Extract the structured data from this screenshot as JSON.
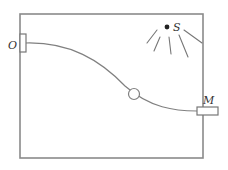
{
  "diagram": {
    "type": "physics-apparatus",
    "labels": {
      "left_block": "O",
      "right_block": "M",
      "source": "S"
    },
    "elements": {
      "frame": "rectangle",
      "left_block": "small vertical block on left wall",
      "right_block": "small horizontal block on right wall",
      "track": "smooth descending curve",
      "ring": "bead on track",
      "source": "point source with radiating rays",
      "ray_count": 5
    },
    "colors": {
      "stroke": "#808080",
      "source_dot": "#222222",
      "label": "#333333"
    }
  }
}
